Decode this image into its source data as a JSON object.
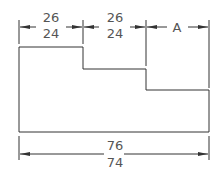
{
  "drawing": {
    "title": "Stepped profile dimensioning exercise",
    "line_color": "#333333",
    "text_color": "#555555",
    "top_dimensions": [
      {
        "upper": "26",
        "lower": "24"
      },
      {
        "upper": "26",
        "lower": "24"
      },
      {
        "label": "A"
      }
    ],
    "bottom_dimension": {
      "upper": "76",
      "lower": "74"
    }
  }
}
